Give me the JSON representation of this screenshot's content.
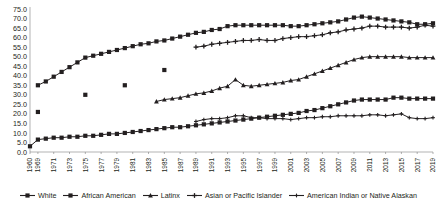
{
  "chart_data": {
    "type": "line",
    "title": "",
    "xlabel": "",
    "ylabel": "",
    "ylim": [
      0,
      75
    ],
    "ytick_step": 5,
    "grid": false,
    "legend_position": "bottom",
    "yticks": [
      "0.0",
      "5.0",
      "10.0",
      "15.0",
      "20.0",
      "25.0",
      "30.0",
      "35.0",
      "40.0",
      "45.0",
      "50.0",
      "55.0",
      "60.0",
      "65.0",
      "70.0",
      "75.0"
    ],
    "xticks": [
      "1960",
      "1969",
      "1971",
      "1973",
      "1975",
      "1977",
      "1979",
      "1981",
      "1983",
      "1985",
      "1987",
      "1989",
      "1991",
      "1993",
      "1995",
      "1997",
      "1999",
      "2001",
      "2003",
      "2005",
      "2007",
      "2009",
      "2011",
      "2013",
      "2015",
      "2017",
      "2019"
    ],
    "x": [
      1960,
      1969,
      1970,
      1971,
      1972,
      1973,
      1974,
      1975,
      1976,
      1977,
      1978,
      1979,
      1980,
      1981,
      1982,
      1983,
      1984,
      1985,
      1986,
      1987,
      1988,
      1989,
      1990,
      1991,
      1992,
      1993,
      1994,
      1995,
      1996,
      1997,
      1998,
      1999,
      2000,
      2001,
      2002,
      2003,
      2004,
      2005,
      2006,
      2007,
      2008,
      2009,
      2010,
      2011,
      2012,
      2013,
      2014,
      2015,
      2016,
      2017,
      2018,
      2019
    ],
    "series": [
      {
        "name": "White",
        "marker": "diamond",
        "color": "#231f20",
        "points": [
          {
            "x": 1969,
            "y": 35.0
          },
          {
            "x": 1970,
            "y": 37.0
          },
          {
            "x": 1971,
            "y": 39.5
          },
          {
            "x": 1972,
            "y": 42.0
          },
          {
            "x": 1973,
            "y": 44.5
          },
          {
            "x": 1974,
            "y": 47.0
          },
          {
            "x": 1975,
            "y": 49.5
          },
          {
            "x": 1976,
            "y": 50.5
          },
          {
            "x": 1977,
            "y": 51.5
          },
          {
            "x": 1978,
            "y": 52.5
          },
          {
            "x": 1979,
            "y": 53.5
          },
          {
            "x": 1980,
            "y": 54.5
          },
          {
            "x": 1981,
            "y": 55.5
          },
          {
            "x": 1982,
            "y": 56.5
          },
          {
            "x": 1983,
            "y": 57.0
          },
          {
            "x": 1984,
            "y": 58.0
          },
          {
            "x": 1985,
            "y": 58.5
          },
          {
            "x": 1986,
            "y": 59.5
          },
          {
            "x": 1987,
            "y": 60.5
          },
          {
            "x": 1988,
            "y": 61.5
          },
          {
            "x": 1989,
            "y": 62.5
          },
          {
            "x": 1990,
            "y": 63.0
          },
          {
            "x": 1991,
            "y": 64.0
          },
          {
            "x": 1992,
            "y": 64.5
          },
          {
            "x": 1993,
            "y": 66.0
          },
          {
            "x": 1994,
            "y": 66.5
          },
          {
            "x": 1995,
            "y": 66.5
          },
          {
            "x": 1996,
            "y": 66.5
          },
          {
            "x": 1997,
            "y": 66.5
          },
          {
            "x": 1998,
            "y": 66.5
          },
          {
            "x": 1999,
            "y": 66.5
          },
          {
            "x": 2000,
            "y": 66.5
          },
          {
            "x": 2001,
            "y": 66.0
          },
          {
            "x": 2002,
            "y": 66.0
          },
          {
            "x": 2003,
            "y": 66.5
          },
          {
            "x": 2004,
            "y": 67.0
          },
          {
            "x": 2005,
            "y": 67.5
          },
          {
            "x": 2006,
            "y": 68.0
          },
          {
            "x": 2007,
            "y": 68.5
          },
          {
            "x": 2008,
            "y": 69.5
          },
          {
            "x": 2009,
            "y": 70.5
          },
          {
            "x": 2010,
            "y": 71.0
          },
          {
            "x": 2011,
            "y": 70.5
          },
          {
            "x": 2012,
            "y": 70.0
          },
          {
            "x": 2013,
            "y": 69.5
          },
          {
            "x": 2014,
            "y": 69.0
          },
          {
            "x": 2015,
            "y": 68.5
          },
          {
            "x": 2016,
            "y": 68.0
          },
          {
            "x": 2017,
            "y": 67.0
          },
          {
            "x": 2018,
            "y": 67.0
          },
          {
            "x": 2019,
            "y": 67.5
          }
        ]
      },
      {
        "name": "African American",
        "marker": "square",
        "color": "#231f20",
        "points": [
          {
            "x": 1960,
            "y": 3.0
          },
          {
            "x": 1969,
            "y": 6.5
          },
          {
            "x": 1970,
            "y": 7.0
          },
          {
            "x": 1971,
            "y": 7.5
          },
          {
            "x": 1972,
            "y": 7.5
          },
          {
            "x": 1973,
            "y": 8.0
          },
          {
            "x": 1974,
            "y": 8.0
          },
          {
            "x": 1975,
            "y": 8.5
          },
          {
            "x": 1976,
            "y": 8.5
          },
          {
            "x": 1977,
            "y": 9.0
          },
          {
            "x": 1978,
            "y": 9.5
          },
          {
            "x": 1979,
            "y": 9.5
          },
          {
            "x": 1980,
            "y": 10.0
          },
          {
            "x": 1981,
            "y": 10.5
          },
          {
            "x": 1982,
            "y": 11.0
          },
          {
            "x": 1983,
            "y": 11.5
          },
          {
            "x": 1984,
            "y": 12.0
          },
          {
            "x": 1985,
            "y": 12.5
          },
          {
            "x": 1986,
            "y": 13.0
          },
          {
            "x": 1987,
            "y": 13.0
          },
          {
            "x": 1988,
            "y": 13.5
          },
          {
            "x": 1989,
            "y": 14.0
          },
          {
            "x": 1990,
            "y": 14.5
          },
          {
            "x": 1991,
            "y": 15.0
          },
          {
            "x": 1992,
            "y": 15.5
          },
          {
            "x": 1993,
            "y": 16.0
          },
          {
            "x": 1994,
            "y": 16.5
          },
          {
            "x": 1995,
            "y": 17.0
          },
          {
            "x": 1996,
            "y": 17.5
          },
          {
            "x": 1997,
            "y": 18.0
          },
          {
            "x": 1998,
            "y": 18.5
          },
          {
            "x": 1999,
            "y": 19.0
          },
          {
            "x": 2000,
            "y": 19.5
          },
          {
            "x": 2001,
            "y": 20.0
          },
          {
            "x": 2002,
            "y": 20.5
          },
          {
            "x": 2003,
            "y": 21.5
          },
          {
            "x": 2004,
            "y": 22.0
          },
          {
            "x": 2005,
            "y": 23.0
          },
          {
            "x": 2006,
            "y": 24.0
          },
          {
            "x": 2007,
            "y": 25.0
          },
          {
            "x": 2008,
            "y": 26.0
          },
          {
            "x": 2009,
            "y": 27.0
          },
          {
            "x": 2010,
            "y": 27.5
          },
          {
            "x": 2011,
            "y": 27.5
          },
          {
            "x": 2012,
            "y": 27.5
          },
          {
            "x": 2013,
            "y": 27.5
          },
          {
            "x": 2014,
            "y": 28.5
          },
          {
            "x": 2015,
            "y": 28.5
          },
          {
            "x": 2016,
            "y": 28.0
          },
          {
            "x": 2017,
            "y": 28.0
          },
          {
            "x": 2018,
            "y": 28.0
          },
          {
            "x": 2019,
            "y": 28.0
          }
        ],
        "isolated_points": [
          {
            "x": 1969,
            "y": 21.0
          },
          {
            "x": 1975,
            "y": 30.0
          },
          {
            "x": 1980,
            "y": 35.0
          },
          {
            "x": 1985,
            "y": 43.0
          }
        ]
      },
      {
        "name": "Latinx",
        "marker": "triangle",
        "color": "#231f20",
        "points": [
          {
            "x": 1984,
            "y": 26.5
          },
          {
            "x": 1985,
            "y": 27.5
          },
          {
            "x": 1986,
            "y": 28.0
          },
          {
            "x": 1987,
            "y": 28.5
          },
          {
            "x": 1988,
            "y": 29.5
          },
          {
            "x": 1989,
            "y": 30.5
          },
          {
            "x": 1990,
            "y": 31.0
          },
          {
            "x": 1991,
            "y": 32.0
          },
          {
            "x": 1992,
            "y": 33.5
          },
          {
            "x": 1993,
            "y": 34.5
          },
          {
            "x": 1994,
            "y": 38.0
          },
          {
            "x": 1995,
            "y": 35.0
          },
          {
            "x": 1996,
            "y": 34.5
          },
          {
            "x": 1997,
            "y": 35.0
          },
          {
            "x": 1998,
            "y": 35.5
          },
          {
            "x": 1999,
            "y": 36.0
          },
          {
            "x": 2000,
            "y": 36.5
          },
          {
            "x": 2001,
            "y": 37.5
          },
          {
            "x": 2002,
            "y": 38.0
          },
          {
            "x": 2003,
            "y": 39.5
          },
          {
            "x": 2004,
            "y": 41.0
          },
          {
            "x": 2005,
            "y": 42.5
          },
          {
            "x": 2006,
            "y": 44.0
          },
          {
            "x": 2007,
            "y": 45.5
          },
          {
            "x": 2008,
            "y": 47.0
          },
          {
            "x": 2009,
            "y": 48.5
          },
          {
            "x": 2010,
            "y": 49.5
          },
          {
            "x": 2011,
            "y": 50.0
          },
          {
            "x": 2012,
            "y": 50.0
          },
          {
            "x": 2013,
            "y": 50.0
          },
          {
            "x": 2014,
            "y": 50.0
          },
          {
            "x": 2015,
            "y": 50.0
          },
          {
            "x": 2016,
            "y": 49.5
          },
          {
            "x": 2017,
            "y": 49.5
          },
          {
            "x": 2018,
            "y": 49.5
          },
          {
            "x": 2019,
            "y": 49.5
          }
        ]
      },
      {
        "name": "Asian or Pacific Islander",
        "marker": "cross",
        "color": "#231f20",
        "points": [
          {
            "x": 1989,
            "y": 55.0
          },
          {
            "x": 1990,
            "y": 55.5
          },
          {
            "x": 1991,
            "y": 56.5
          },
          {
            "x": 1992,
            "y": 57.0
          },
          {
            "x": 1993,
            "y": 57.5
          },
          {
            "x": 1994,
            "y": 58.0
          },
          {
            "x": 1995,
            "y": 58.5
          },
          {
            "x": 1996,
            "y": 58.5
          },
          {
            "x": 1997,
            "y": 59.0
          },
          {
            "x": 1998,
            "y": 58.5
          },
          {
            "x": 1999,
            "y": 58.5
          },
          {
            "x": 2000,
            "y": 59.5
          },
          {
            "x": 2001,
            "y": 60.0
          },
          {
            "x": 2002,
            "y": 60.5
          },
          {
            "x": 2003,
            "y": 60.5
          },
          {
            "x": 2004,
            "y": 61.0
          },
          {
            "x": 2005,
            "y": 61.5
          },
          {
            "x": 2006,
            "y": 62.5
          },
          {
            "x": 2007,
            "y": 63.0
          },
          {
            "x": 2008,
            "y": 64.0
          },
          {
            "x": 2009,
            "y": 64.5
          },
          {
            "x": 2010,
            "y": 65.0
          },
          {
            "x": 2011,
            "y": 66.0
          },
          {
            "x": 2012,
            "y": 66.0
          },
          {
            "x": 2013,
            "y": 65.5
          },
          {
            "x": 2014,
            "y": 65.5
          },
          {
            "x": 2015,
            "y": 65.5
          },
          {
            "x": 2016,
            "y": 65.0
          },
          {
            "x": 2017,
            "y": 65.5
          },
          {
            "x": 2018,
            "y": 66.5
          },
          {
            "x": 2019,
            "y": 66.0
          }
        ]
      },
      {
        "name": "American Indian or Native Alaskan",
        "marker": "cross-small",
        "color": "#231f20",
        "points": [
          {
            "x": 1989,
            "y": 16.0
          },
          {
            "x": 1990,
            "y": 17.0
          },
          {
            "x": 1991,
            "y": 17.5
          },
          {
            "x": 1992,
            "y": 17.5
          },
          {
            "x": 1993,
            "y": 18.0
          },
          {
            "x": 1994,
            "y": 19.0
          },
          {
            "x": 1995,
            "y": 19.0
          },
          {
            "x": 1996,
            "y": 18.0
          },
          {
            "x": 1997,
            "y": 18.0
          },
          {
            "x": 1998,
            "y": 17.5
          },
          {
            "x": 1999,
            "y": 17.5
          },
          {
            "x": 2000,
            "y": 17.5
          },
          {
            "x": 2001,
            "y": 17.0
          },
          {
            "x": 2002,
            "y": 17.5
          },
          {
            "x": 2003,
            "y": 18.0
          },
          {
            "x": 2004,
            "y": 18.0
          },
          {
            "x": 2005,
            "y": 18.5
          },
          {
            "x": 2006,
            "y": 18.5
          },
          {
            "x": 2007,
            "y": 19.0
          },
          {
            "x": 2008,
            "y": 19.0
          },
          {
            "x": 2009,
            "y": 19.0
          },
          {
            "x": 2010,
            "y": 19.0
          },
          {
            "x": 2011,
            "y": 19.5
          },
          {
            "x": 2012,
            "y": 19.5
          },
          {
            "x": 2013,
            "y": 19.0
          },
          {
            "x": 2014,
            "y": 19.5
          },
          {
            "x": 2015,
            "y": 20.0
          },
          {
            "x": 2016,
            "y": 18.0
          },
          {
            "x": 2017,
            "y": 17.5
          },
          {
            "x": 2018,
            "y": 17.5
          },
          {
            "x": 2019,
            "y": 18.0
          }
        ]
      }
    ]
  },
  "legend": {
    "items": [
      {
        "label": "White"
      },
      {
        "label": "African American"
      },
      {
        "label": "Latinx"
      },
      {
        "label": "Asian or Pacific Islander"
      },
      {
        "label": "American Indian or Native Alaskan"
      }
    ]
  }
}
